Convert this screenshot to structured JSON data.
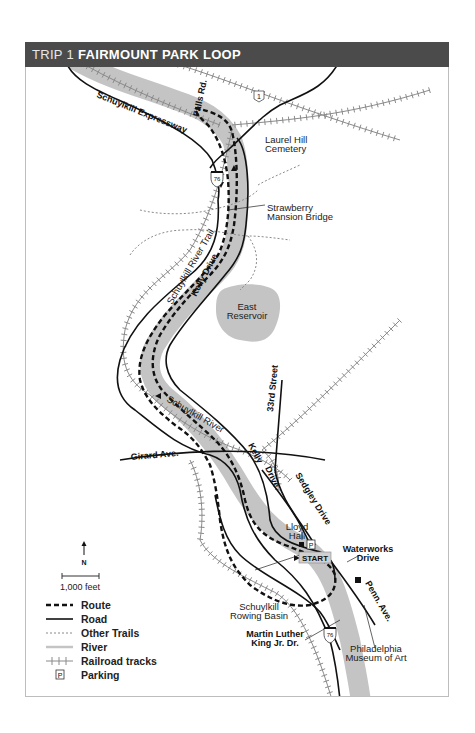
{
  "header": {
    "trip": "TRIP 1",
    "title": "FAIRMOUNT PARK LOOP"
  },
  "colors": {
    "header_bg": "#4b4b4b",
    "river": "#c4c4c4",
    "reservoir": "#c4c4c4",
    "road": "#111111",
    "route": "#111111",
    "trail": "#8a8a8a",
    "rail": "#8a8a8a"
  },
  "labels": {
    "falls_rd": "Falls Rd.",
    "schuylkill_expressway": "Schuylkill Expressway",
    "us1_shield": "1",
    "i76_shield_north": "76",
    "i76_shield_south": "76",
    "laurel_hill_1": "Laurel Hill",
    "laurel_hill_2": "Cemetery",
    "strawberry_1": "Strawberry",
    "strawberry_2": "Mansion Bridge",
    "schuylkill_river_trail": "Schuylkill River Trail",
    "kelly_drive": "Kelly Drive",
    "east_reservoir_1": "East",
    "east_reservoir_2": "Reservoir",
    "thirty_third_street": "33rd Street",
    "schuylkill_river": "Schuylkill River",
    "kelly_lower": "Kelly",
    "drive_lower": "Drive",
    "girard_ave": "Girard Ave.",
    "sedgley_drive": "Sedgley Drive",
    "lloyd_hall_1": "Lloyd",
    "lloyd_hall_2": "Hall",
    "parking_marker": "P",
    "start": "START",
    "waterworks_1": "Waterworks",
    "waterworks_2": "Drive",
    "penn_ave": "Penn. Ave.",
    "rowing_basin_1": "Schuylkill",
    "rowing_basin_2": "Rowing Basin",
    "mlk_1": "Martin Luther",
    "mlk_2": "King Jr. Dr.",
    "museum_1": "Philadelphia",
    "museum_2": "Museum of Art"
  },
  "compass": {
    "label": "N"
  },
  "scale": {
    "label": "1,000 feet"
  },
  "legend": [
    {
      "key": "route",
      "label": "Route"
    },
    {
      "key": "road",
      "label": "Road"
    },
    {
      "key": "trails",
      "label": "Other Trails"
    },
    {
      "key": "river",
      "label": "River"
    },
    {
      "key": "rail",
      "label": "Railroad tracks"
    },
    {
      "key": "parking",
      "label": "Parking",
      "symbol": "P"
    }
  ]
}
